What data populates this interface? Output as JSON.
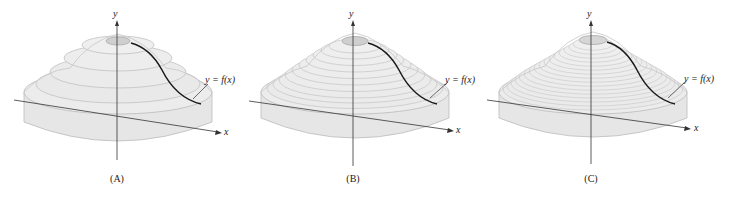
{
  "figure": {
    "colors": {
      "solid_fill": "#e8e8e8",
      "solid_edge": "#b8b8b8",
      "axis": "#333333",
      "curve": "#1a1a1a",
      "top_disk": "#cfcfcf"
    },
    "panels": [
      {
        "id": "A",
        "caption": "(A)",
        "y_axis_label": "y",
        "x_axis_label": "x",
        "curve_label": "y = f(x)",
        "disk_count": 5
      },
      {
        "id": "B",
        "caption": "(B)",
        "y_axis_label": "y",
        "x_axis_label": "x",
        "curve_label": "y = f(x)",
        "disk_count": 12
      },
      {
        "id": "C",
        "caption": "(C)",
        "y_axis_label": "y",
        "x_axis_label": "x",
        "curve_label": "y = f(x)",
        "disk_count": 20
      }
    ]
  }
}
